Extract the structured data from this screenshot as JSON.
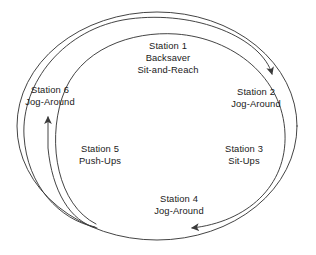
{
  "diagram": {
    "type": "circular-flow",
    "stroke_color": "#3a3a3a",
    "text_color": "#1a1a1a",
    "background_color": "#ffffff",
    "stations": [
      {
        "id": "station-1",
        "number": "Station 1",
        "line1": "Backsaver",
        "line2": "Sit-and-Reach",
        "position": "top-center"
      },
      {
        "id": "station-2",
        "number": "Station 2",
        "line1": "Jog-Around",
        "line2": "",
        "position": "upper-right"
      },
      {
        "id": "station-3",
        "number": "Station 3",
        "line1": "Sit-Ups",
        "line2": "",
        "position": "lower-right"
      },
      {
        "id": "station-4",
        "number": "Station 4",
        "line1": "Jog-Around",
        "line2": "",
        "position": "bottom-center"
      },
      {
        "id": "station-5",
        "number": "Station 5",
        "line1": "Push-Ups",
        "line2": "",
        "position": "lower-left"
      },
      {
        "id": "station-6",
        "number": "Station 6",
        "line1": "Jog-Around",
        "line2": "",
        "position": "upper-left"
      }
    ],
    "arrows": [
      {
        "id": "arrow-to-station-2",
        "direction": "down-right",
        "target": "Station 2"
      },
      {
        "id": "arrow-to-station-4",
        "direction": "left",
        "target": "Station 4"
      },
      {
        "id": "arrow-to-station-6",
        "direction": "up",
        "target": "Station 6"
      }
    ]
  }
}
